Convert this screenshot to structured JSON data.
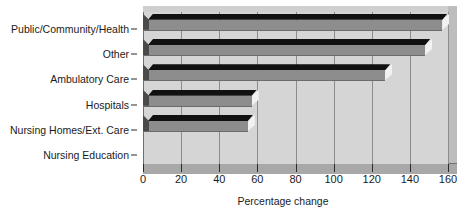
{
  "chart_data": {
    "type": "bar",
    "orientation": "horizontal",
    "title": "",
    "xlabel": "Percentage change",
    "ylabel": "",
    "xlim": [
      0,
      160
    ],
    "xticks": [
      0,
      20,
      40,
      60,
      80,
      100,
      120,
      140,
      160
    ],
    "xtick_labels": [
      "0",
      "20",
      "40",
      "60",
      "80",
      "100",
      "120",
      "140",
      "160"
    ],
    "grid": true,
    "legend": "none",
    "categories": [
      "Public/Community/Health",
      "Other",
      "Ambulatory Care",
      "Hospitals",
      "Nursing Homes/Ext. Care",
      "Nursing Education"
    ],
    "values": [
      157,
      148,
      127,
      57,
      55,
      0
    ],
    "series": [
      {
        "name": "Percentage change",
        "values": [
          157,
          148,
          127,
          57,
          55,
          0
        ]
      }
    ],
    "colors": {
      "bar_front": "#8d8d8d",
      "bar_top": "#111111",
      "bar_cap": "#f2f2f2",
      "bar_side": "#4a4a4a",
      "plot_background": "#d5d5d5",
      "floor": "#a8a8a8",
      "gridline": "#8c8c8c",
      "text": "#1b1b1b"
    }
  }
}
